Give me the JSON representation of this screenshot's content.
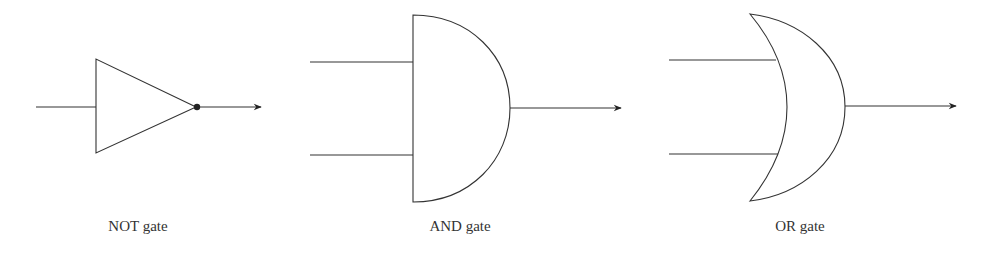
{
  "diagram": {
    "type": "logic-gates",
    "colors": {
      "stroke": "#333333",
      "background": "#ffffff",
      "text": "#333333"
    },
    "gates": [
      {
        "id": "not",
        "label": "NOT gate",
        "inputs": 1,
        "outputs": 1,
        "inverted_output_dot": true
      },
      {
        "id": "and",
        "label": "AND gate",
        "inputs": 2,
        "outputs": 1
      },
      {
        "id": "or",
        "label": "OR gate",
        "inputs": 2,
        "outputs": 1
      }
    ]
  }
}
